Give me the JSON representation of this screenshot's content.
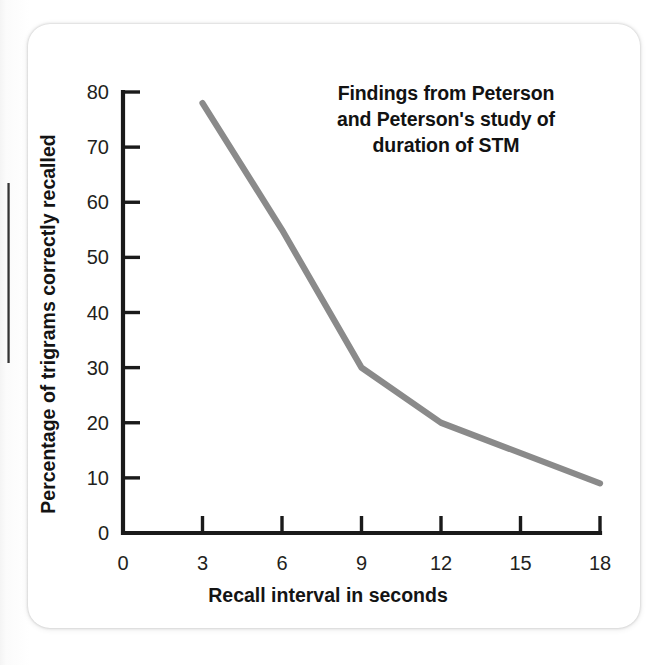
{
  "figure": {
    "card_background": "#ffffff",
    "page_background": "#ffffff"
  },
  "chart_data": {
    "type": "line",
    "title_lines": [
      "Findings from Peterson",
      "and Peterson's study of",
      "duration of STM"
    ],
    "subtitle": "",
    "xlabel": "Recall interval in seconds",
    "ylabel": "Percentage of trigrams correctly recalled",
    "x": [
      3,
      6,
      9,
      12,
      18
    ],
    "values": [
      78,
      55,
      30,
      20,
      9
    ],
    "series": [
      {
        "name": "Percentage of trigrams correctly recalled",
        "color": "#8a8a8a",
        "x": [
          3,
          6,
          9,
          12,
          18
        ],
        "values": [
          78,
          55,
          30,
          20,
          9
        ]
      }
    ],
    "xlim": [
      0,
      18
    ],
    "ylim": [
      0,
      80
    ],
    "xticks": [
      0,
      3,
      6,
      9,
      12,
      15,
      18
    ],
    "xtick_labels": [
      "0",
      "3",
      "6",
      "9",
      "12",
      "15",
      "18"
    ],
    "yticks": [
      0,
      10,
      20,
      30,
      40,
      50,
      60,
      70,
      80
    ],
    "ytick_labels": [
      "0",
      "10",
      "20",
      "30",
      "40",
      "50",
      "60",
      "70",
      "80"
    ],
    "grid": false,
    "legend": false,
    "legend_position": "none",
    "line_color": "#8a8a8a",
    "axis_color": "#1a1a1a",
    "annotations": []
  }
}
